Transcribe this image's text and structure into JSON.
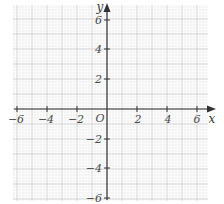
{
  "chart_data": {
    "type": "coordinate-grid",
    "title": "",
    "xlabel": "x",
    "ylabel": "y",
    "origin_label": "O",
    "xlim": [
      -6,
      6
    ],
    "ylim": [
      -6,
      6
    ],
    "x_ticks": [
      -6,
      -4,
      -2,
      2,
      4,
      6
    ],
    "y_ticks": [
      6,
      4,
      2,
      -2,
      -4,
      -6
    ],
    "x_tick_labels": [
      "−6",
      "−4",
      "−2",
      "2",
      "4",
      "6"
    ],
    "y_tick_labels": [
      "6",
      "4",
      "2",
      "−2",
      "−4",
      "−6"
    ],
    "grid": true,
    "grid_minor_step": 0.2,
    "grid_major_step": 1,
    "series": []
  },
  "colors": {
    "grid_minor": "#e4e4e4",
    "grid_major": "#c8c8c8",
    "axis": "#333333",
    "text": "#4a4a4a"
  },
  "labels": {
    "x_axis": "x",
    "y_axis": "y",
    "origin": "O",
    "xt0": "−6",
    "xt1": "−4",
    "xt2": "−2",
    "xt3": "2",
    "xt4": "4",
    "xt5": "6",
    "yt0": "6",
    "yt1": "4",
    "yt2": "2",
    "yt3": "−2",
    "yt4": "−4",
    "yt5": "−6"
  }
}
